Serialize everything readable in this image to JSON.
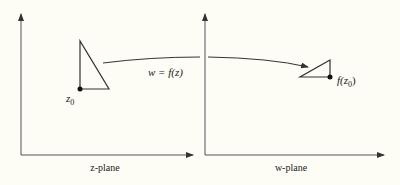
{
  "diagram": {
    "mapping_label": "w = f(z)",
    "left_plane": {
      "label": "z-plane",
      "point_label_base": "z",
      "point_label_sub": "0"
    },
    "right_plane": {
      "label": "w-plane",
      "point_label_prefix": "f(z",
      "point_label_sub": "0",
      "point_label_suffix": ")"
    },
    "colors": {
      "background": "#fdfcf5",
      "ink": "#222222",
      "axis": "#444444"
    }
  }
}
